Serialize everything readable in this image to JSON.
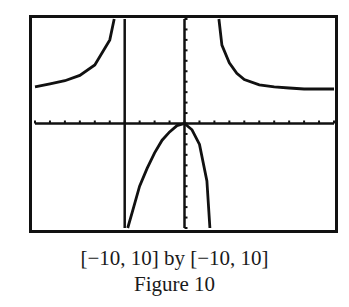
{
  "chart_data": {
    "type": "line",
    "title": "",
    "window": "[-10, 10] by [-10, 10]",
    "xlim": [
      -10,
      10
    ],
    "ylim": [
      -10,
      10
    ],
    "xlabel": "",
    "ylabel": "",
    "grid": false,
    "xscl": 1,
    "yscl": 1,
    "vertical_asymptotes": [
      -4,
      2
    ],
    "horizontal_asymptote": 3,
    "series": [
      {
        "name": "left-branch",
        "x": [
          -10,
          -9,
          -8,
          -7,
          -6,
          -5,
          -4.7
        ],
        "y": [
          3.5,
          3.8,
          4.1,
          4.6,
          5.6,
          8.0,
          10
        ]
      },
      {
        "name": "middle-branch",
        "x": [
          -3.8,
          -3.5,
          -3,
          -2.5,
          -2,
          -1.5,
          -1,
          -0.5,
          0,
          0.5,
          1,
          1.5,
          1.7
        ],
        "y": [
          -10,
          -8.5,
          -6,
          -4.3,
          -2.8,
          -1.6,
          -0.8,
          -0.2,
          0,
          -0.6,
          -2.0,
          -5.5,
          -10
        ]
      },
      {
        "name": "right-branch",
        "x": [
          2.3,
          2.5,
          3,
          3.5,
          4,
          5,
          6,
          7,
          8,
          9,
          10
        ],
        "y": [
          10,
          7.5,
          5.8,
          4.8,
          4.2,
          3.7,
          3.5,
          3.4,
          3.3,
          3.3,
          3.3
        ]
      }
    ]
  },
  "caption": {
    "window_text": "[−10, 10] by [−10, 10]",
    "figure_label": "Figure 10"
  }
}
